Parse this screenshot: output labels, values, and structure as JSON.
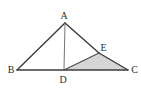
{
  "figure": {
    "type": "geometry-diagram",
    "background_color": "#ffffff",
    "label_color": "#2e2e2e",
    "shade_fill": "#dcdcdc",
    "shade_dot": "#b2b2b2",
    "line_styles": {
      "thick": {
        "color": "#3c3c3c",
        "width": 1.4
      },
      "medium": {
        "color": "#4a4a4a",
        "width": 1.1
      },
      "thin": {
        "color": "#6e6e6e",
        "width": 0.95
      }
    },
    "points": {
      "A": {
        "x": 65,
        "y": 23
      },
      "B": {
        "x": 17,
        "y": 70
      },
      "C": {
        "x": 128,
        "y": 70
      },
      "D": {
        "x": 64,
        "y": 70
      },
      "E": {
        "x": 99,
        "y": 53
      }
    },
    "segments": [
      {
        "from": "A",
        "to": "B",
        "weight": "thick"
      },
      {
        "from": "B",
        "to": "C",
        "weight": "thick"
      },
      {
        "from": "A",
        "to": "E",
        "weight": "thick"
      },
      {
        "from": "E",
        "to": "C",
        "weight": "thick"
      },
      {
        "from": "A",
        "to": "D",
        "weight": "thin"
      },
      {
        "from": "D",
        "to": "E",
        "weight": "medium"
      }
    ],
    "shaded_region": [
      "D",
      "E",
      "C"
    ],
    "labels": [
      {
        "text": "A",
        "x": 64,
        "y": 19
      },
      {
        "text": "B",
        "x": 11,
        "y": 73
      },
      {
        "text": "C",
        "x": 134.5,
        "y": 73
      },
      {
        "text": "D",
        "x": 63,
        "y": 83
      },
      {
        "text": "E",
        "x": 103.5,
        "y": 51
      }
    ]
  }
}
